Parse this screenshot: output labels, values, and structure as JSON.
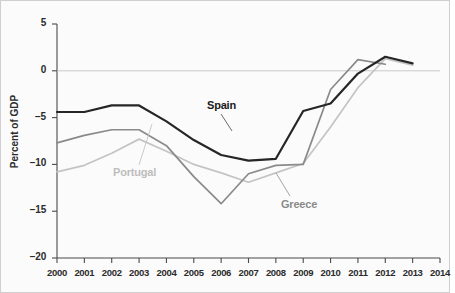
{
  "chart_data": {
    "type": "line",
    "title": "",
    "subtitle": "",
    "xlabel": "",
    "ylabel": "Percent of GDP",
    "x": [
      2000,
      2001,
      2002,
      2003,
      2004,
      2005,
      2006,
      2007,
      2008,
      2009,
      2010,
      2011,
      2012,
      2013,
      2014
    ],
    "xticklabels": [
      "2000",
      "2001",
      "2002",
      "2003",
      "2004",
      "2005",
      "2006",
      "2007",
      "2008",
      "2009",
      "2010",
      "2011",
      "2012",
      "2013",
      "2014"
    ],
    "yticklabels": [
      "5",
      "0",
      "−5",
      "−10",
      "−15",
      "−20"
    ],
    "yticks": [
      5,
      0,
      -5,
      -10,
      -15,
      -20
    ],
    "ylim": [
      -20,
      5
    ],
    "xlim": [
      2000,
      2014
    ],
    "grid": false,
    "zero_line": true,
    "legend": "inline-labels",
    "series": [
      {
        "name": "Spain",
        "color": "#262626",
        "values": [
          -4.4,
          -4.4,
          -3.7,
          -3.7,
          -5.4,
          -7.4,
          -9.0,
          -9.6,
          -9.4,
          -4.3,
          -3.5,
          -0.3,
          1.5,
          0.8,
          null
        ]
      },
      {
        "name": "Greece",
        "color": "#8a8a8a",
        "values": [
          -7.7,
          -6.9,
          -6.3,
          -6.3,
          -8.0,
          -11.3,
          -14.2,
          -11.0,
          -10.1,
          -10.0,
          -2.0,
          1.2,
          0.7,
          null,
          null
        ]
      },
      {
        "name": "Portugal",
        "color": "#c4c4c4",
        "values": [
          -10.8,
          -10.1,
          -8.8,
          -7.3,
          -8.6,
          -10.0,
          -10.9,
          -11.9,
          -10.9,
          -9.9,
          -6.0,
          -1.8,
          1.3,
          0.6,
          null
        ]
      }
    ],
    "annotations": [
      {
        "text": "Spain",
        "series": "Spain",
        "color": "#1a1a1a"
      },
      {
        "text": "Portugal",
        "series": "Portugal",
        "color": "#bdbdbd"
      },
      {
        "text": "Greece",
        "series": "Greece",
        "color": "#8a8a8a"
      }
    ]
  },
  "axis": {
    "y_title": "Percent of GDP",
    "y_ticks": [
      "5",
      "0",
      "−5",
      "−10",
      "−15",
      "−20"
    ],
    "x_ticks": [
      "2000",
      "2001",
      "2002",
      "2003",
      "2004",
      "2005",
      "2006",
      "2007",
      "2008",
      "2009",
      "2010",
      "2011",
      "2012",
      "2013",
      "2014"
    ]
  },
  "labels": {
    "spain": "Spain",
    "portugal": "Portugal",
    "greece": "Greece"
  }
}
